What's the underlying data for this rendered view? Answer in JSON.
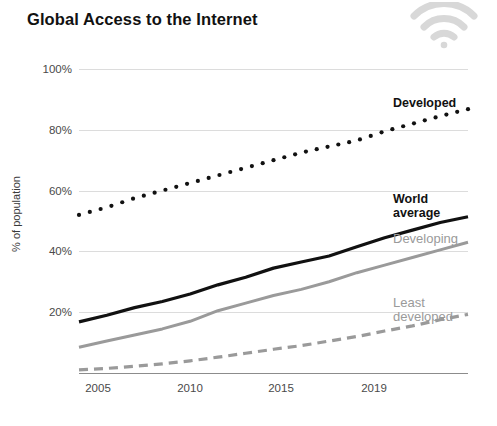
{
  "header": {
    "title": "Global Access to the Internet",
    "icon": "wifi-icon"
  },
  "chart_data": {
    "type": "line",
    "title": "Global Access to the Internet",
    "xlabel": "",
    "ylabel": "% of population",
    "x": [
      2005,
      2006,
      2007,
      2008,
      2009,
      2010,
      2011,
      2012,
      2013,
      2014,
      2015,
      2016,
      2017,
      2018,
      2019
    ],
    "xticks": [
      "2005",
      "2010",
      "2015",
      "2019"
    ],
    "xtick_values": [
      2005,
      2010,
      2015,
      2019
    ],
    "xlim": [
      2005,
      2019
    ],
    "yticks": [
      "20%",
      "40%",
      "60%",
      "80%",
      "100%"
    ],
    "ytick_values": [
      20,
      40,
      60,
      80,
      100
    ],
    "ylim": [
      0,
      100
    ],
    "grid": true,
    "legend_position": "right-inline",
    "series": [
      {
        "name": "Developed",
        "label": "Developed",
        "style": "dotted",
        "color": "#111111",
        "values": [
          52.0,
          54.5,
          57.5,
          60.0,
          62.5,
          65.0,
          67.5,
          70.0,
          72.5,
          74.5,
          76.5,
          79.5,
          82.0,
          84.5,
          86.8
        ]
      },
      {
        "name": "World average",
        "label": "World\naverage",
        "style": "solid",
        "color": "#111111",
        "values": [
          16.8,
          19.0,
          21.5,
          23.5,
          26.0,
          29.0,
          31.5,
          34.5,
          36.5,
          38.5,
          41.5,
          44.5,
          47.0,
          49.5,
          51.4
        ]
      },
      {
        "name": "Developing",
        "label": "Developing",
        "style": "solid",
        "color": "#9a9a9a",
        "values": [
          8.5,
          10.5,
          12.5,
          14.5,
          17.0,
          20.5,
          23.0,
          25.5,
          27.5,
          30.0,
          33.0,
          35.5,
          38.0,
          40.5,
          43.0
        ]
      },
      {
        "name": "Least developed",
        "label": "Least\ndeveloped",
        "style": "dashed",
        "color": "#9a9a9a",
        "values": [
          1.0,
          1.5,
          2.2,
          3.0,
          4.0,
          5.2,
          6.5,
          7.8,
          9.0,
          10.5,
          12.0,
          13.8,
          15.5,
          17.5,
          19.3
        ]
      }
    ]
  },
  "labels": {
    "developed": "Developed",
    "world_average_line1": "World",
    "world_average_line2": "average",
    "developing": "Developing",
    "least_developed_line1": "Least",
    "least_developed_line2": "developed"
  },
  "colors": {
    "dark": "#111111",
    "light_gray": "#9a9a9a",
    "gridline": "#dcdcdc",
    "axis": "#8c8c8c",
    "tick_text": "#4a4a4a"
  }
}
